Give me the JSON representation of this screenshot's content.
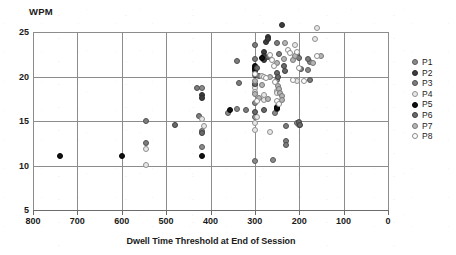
{
  "chart_data": {
    "type": "scatter",
    "title": "",
    "ylabel": "WPM",
    "xlabel": "Dwell Time Threshold at End of Session",
    "xlim": [
      800,
      0
    ],
    "x_reversed": true,
    "ylim": [
      5,
      25
    ],
    "grid": true,
    "legend_position": "right",
    "xticks": [
      800,
      700,
      600,
      500,
      400,
      300,
      200,
      100,
      0
    ],
    "yticks": [
      5,
      10,
      15,
      20,
      25
    ],
    "series": [
      {
        "name": "P1",
        "color": "#7a7a7a",
        "fill": "#8a8a8a",
        "stroke": "#5a5a5a",
        "points": [
          [
            420,
            18.7
          ],
          [
            420,
            13.9
          ],
          [
            420,
            12.1
          ],
          [
            360,
            15.9
          ],
          [
            340,
            16.3
          ],
          [
            300,
            15.5
          ],
          [
            300,
            17.0
          ],
          [
            300,
            19.0
          ],
          [
            300,
            10.5
          ],
          [
            260,
            10.6
          ],
          [
            255,
            15.9
          ],
          [
            250,
            19.6
          ],
          [
            205,
            14.8
          ],
          [
            200,
            14.5
          ],
          [
            180,
            20.7
          ],
          [
            175,
            21.6
          ]
        ]
      },
      {
        "name": "P2",
        "color": "#4a4a4a",
        "fill": "#3d3d3d",
        "stroke": "#2a2a2a",
        "points": [
          [
            420,
            17.9
          ],
          [
            420,
            17.6
          ],
          [
            300,
            21.0
          ],
          [
            300,
            20.6
          ],
          [
            300,
            20.2
          ],
          [
            280,
            22.7
          ],
          [
            280,
            22.3
          ],
          [
            280,
            21.9
          ],
          [
            275,
            23.9
          ],
          [
            270,
            24.4
          ],
          [
            270,
            24.2
          ],
          [
            240,
            25.8
          ],
          [
            250,
            16.6
          ],
          [
            250,
            16.4
          ]
        ]
      },
      {
        "name": "P3",
        "color": "#6e6e6e",
        "fill": "#7d7d7d",
        "stroke": "#4f4f4f",
        "points": [
          [
            545,
            15.0
          ],
          [
            545,
            12.5
          ],
          [
            430,
            18.7
          ],
          [
            425,
            15.6
          ],
          [
            340,
            21.7
          ],
          [
            335,
            19.3
          ],
          [
            320,
            16.2
          ],
          [
            300,
            22.0
          ],
          [
            300,
            23.5
          ],
          [
            290,
            20.1
          ],
          [
            250,
            23.8
          ],
          [
            245,
            22.5
          ],
          [
            230,
            12.8
          ],
          [
            230,
            12.3
          ],
          [
            230,
            14.4
          ],
          [
            205,
            22.4
          ],
          [
            200,
            22.1
          ],
          [
            195,
            20.8
          ],
          [
            180,
            22.0
          ],
          [
            175,
            19.6
          ]
        ]
      },
      {
        "name": "P4",
        "color": "#d0d0d0",
        "fill": "#e8e8e8",
        "stroke": "#8f8f8f",
        "points": [
          [
            545,
            11.8
          ],
          [
            545,
            10.1
          ],
          [
            420,
            15.2
          ],
          [
            415,
            14.4
          ],
          [
            300,
            18.7
          ],
          [
            300,
            18.3
          ],
          [
            300,
            14.8
          ],
          [
            300,
            14.0
          ],
          [
            295,
            15.5
          ],
          [
            285,
            20.1
          ],
          [
            280,
            17.9
          ],
          [
            280,
            17.4
          ],
          [
            265,
            13.8
          ],
          [
            250,
            18.4
          ],
          [
            250,
            18.1
          ],
          [
            245,
            17.0
          ],
          [
            210,
            23.5
          ],
          [
            205,
            19.5
          ],
          [
            165,
            24.2
          ],
          [
            160,
            25.5
          ]
        ]
      },
      {
        "name": "P5",
        "color": "#111111",
        "fill": "#111111",
        "stroke": "#000000",
        "points": [
          [
            740,
            11.1
          ],
          [
            600,
            11.1
          ],
          [
            420,
            11.1
          ],
          [
            355,
            16.2
          ],
          [
            300,
            21.2
          ],
          [
            300,
            20.8
          ],
          [
            285,
            22.1
          ],
          [
            250,
            16.5
          ]
        ]
      },
      {
        "name": "P6",
        "color": "#5e5e5e",
        "fill": "#6a6a6a",
        "stroke": "#3f3f3f",
        "points": [
          [
            480,
            14.6
          ],
          [
            420,
            13.6
          ],
          [
            300,
            19.2
          ],
          [
            300,
            16.0
          ],
          [
            295,
            21.0
          ],
          [
            280,
            16.2
          ],
          [
            270,
            22.2
          ],
          [
            250,
            20.4
          ],
          [
            248,
            19.9
          ],
          [
            235,
            21.2
          ],
          [
            232,
            20.6
          ],
          [
            200,
            14.9
          ],
          [
            198,
            14.6
          ]
        ]
      },
      {
        "name": "P7",
        "color": "#a8a8a8",
        "fill": "#b5b5b5",
        "stroke": "#777777",
        "points": [
          [
            300,
            19.5
          ],
          [
            300,
            18.0
          ],
          [
            290,
            17.6
          ],
          [
            285,
            19.1
          ],
          [
            270,
            17.5
          ],
          [
            265,
            20.0
          ],
          [
            250,
            21.5
          ],
          [
            248,
            18.9
          ],
          [
            245,
            18.6
          ],
          [
            243,
            18.2
          ],
          [
            240,
            17.8
          ],
          [
            238,
            17.4
          ],
          [
            235,
            22.0
          ],
          [
            232,
            23.8
          ],
          [
            215,
            21.8
          ],
          [
            210,
            22.3
          ],
          [
            170,
            21.5
          ],
          [
            150,
            22.3
          ]
        ]
      },
      {
        "name": "P8",
        "color": "#ffffff",
        "fill": "#fdfdfd",
        "stroke": "#8a8a8a",
        "points": [
          [
            300,
            20.3
          ],
          [
            295,
            17.2
          ],
          [
            280,
            20.0
          ],
          [
            275,
            19.8
          ],
          [
            265,
            22.4
          ],
          [
            262,
            21.8
          ],
          [
            258,
            21.2
          ],
          [
            255,
            19.4
          ],
          [
            250,
            17.2
          ],
          [
            245,
            16.9
          ],
          [
            225,
            23.0
          ],
          [
            220,
            22.6
          ],
          [
            215,
            19.6
          ],
          [
            205,
            22.7
          ],
          [
            200,
            21.0
          ],
          [
            190,
            19.5
          ],
          [
            160,
            22.3
          ]
        ]
      }
    ]
  }
}
